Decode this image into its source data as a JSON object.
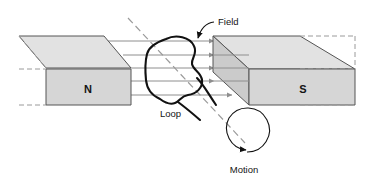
{
  "diagram": {
    "labels": {
      "field": "Field",
      "loop": "Loop",
      "motion": "Motion",
      "north_pole": "N",
      "south_pole": "S"
    },
    "colors": {
      "background": "#ffffff",
      "magnet_face": "#d9d9d9",
      "magnet_top": "#e4e4e4",
      "magnet_side": "#cfcfcf",
      "magnet_edge": "#555555",
      "magnet_edge_dashed": "#8c8c8c",
      "field_line": "#8e8e8e",
      "loop_stroke": "#000000",
      "axis_dashed": "#9a9a9a",
      "text": "#141414"
    },
    "field_lines": {
      "count": 5,
      "direction": "left-to-right",
      "y_positions": [
        41,
        55,
        68,
        81,
        95
      ]
    },
    "motion": {
      "indicator": "circular-arrow",
      "direction": "clockwise"
    }
  }
}
